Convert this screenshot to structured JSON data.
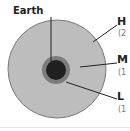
{
  "diagram": {
    "center_label": "Earth",
    "zones": [
      {
        "key": "high",
        "label": "H",
        "sub": "(2"
      },
      {
        "key": "medium",
        "label": "M",
        "sub": "(1"
      },
      {
        "key": "low",
        "label": "L",
        "sub": "(1"
      }
    ],
    "colors": {
      "outer_fill": "#bdbdbd",
      "outer_stroke": "#7a7a7a",
      "ring_fill": "#7c7c7c",
      "core_fill": "#202020",
      "leader_line": "#222222"
    }
  }
}
